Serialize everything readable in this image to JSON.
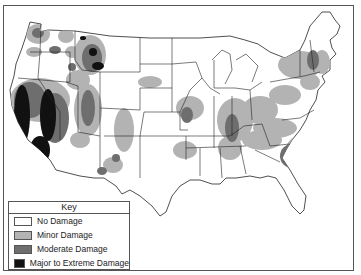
{
  "map": {
    "subject": "United States damage map",
    "colors": {
      "no_damage": "#ffffff",
      "minor_damage": "#b3b3b3",
      "moderate_damage": "#6e6e6e",
      "major_damage": "#111111",
      "borders": "#222222"
    }
  },
  "key": {
    "title": "Key",
    "items": [
      {
        "label": "No Damage",
        "color": "#ffffff"
      },
      {
        "label": "Minor Damage",
        "color": "#b3b3b3"
      },
      {
        "label": "Moderate Damage",
        "color": "#6e6e6e"
      },
      {
        "label": "Major to Extreme Damage",
        "color": "#111111"
      }
    ]
  }
}
